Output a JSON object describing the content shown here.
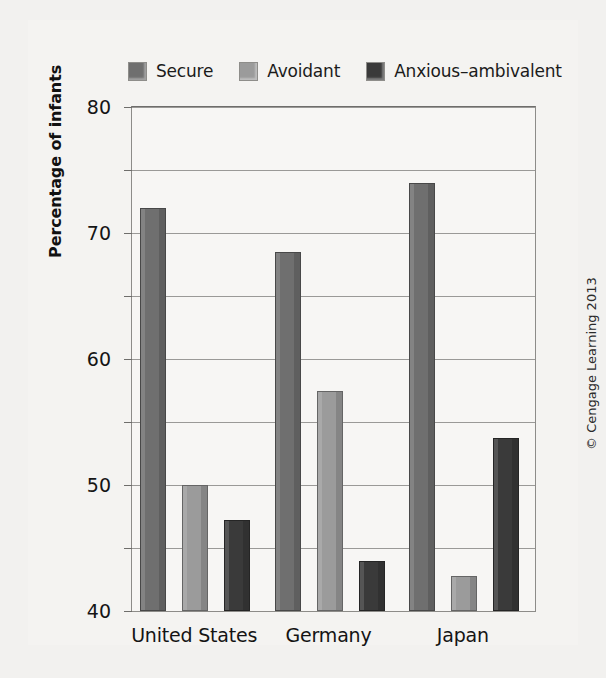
{
  "figure": {
    "credit": "© Cengage Learning 2013"
  },
  "legend": {
    "position": "top",
    "items": [
      {
        "label": "Secure",
        "color": "#6f6f6f",
        "swatch_name": "legend-swatch-secure"
      },
      {
        "label": "Avoidant",
        "color": "#9b9b9b",
        "swatch_name": "legend-swatch-avoidant"
      },
      {
        "label": "Anxious–ambivalent",
        "color": "#3a3a3a",
        "swatch_name": "legend-swatch-anxious-ambivalent"
      }
    ]
  },
  "chart_data": {
    "type": "bar",
    "title": "",
    "subtitle": "",
    "xlabel": "",
    "ylabel": "Percentage of infants",
    "ylim": [
      0,
      80
    ],
    "yticks": [
      0,
      10,
      20,
      30,
      40,
      50,
      60,
      70,
      80
    ],
    "ytick_labels": [
      "0",
      "10",
      "20",
      "30",
      "40",
      "50",
      "60",
      "70",
      "80"
    ],
    "grid": "horizontal",
    "legend_position": "top",
    "categories": [
      "United States",
      "Germany",
      "Japan"
    ],
    "series": [
      {
        "name": "Secure",
        "color": "#6f6f6f",
        "values": [
          64,
          57,
          68
        ]
      },
      {
        "name": "Avoidant",
        "color": "#9b9b9b",
        "values": [
          20,
          35,
          5.5
        ]
      },
      {
        "name": "Anxious–ambivalent",
        "color": "#3a3a3a",
        "values": [
          14.5,
          8,
          27.5
        ]
      }
    ]
  }
}
